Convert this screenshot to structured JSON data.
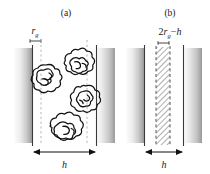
{
  "figure": {
    "type": "scientific-diagram",
    "background_color": "#ffffff",
    "ink_color": "#1a1a1a",
    "width": 210,
    "height": 174
  },
  "panel_a": {
    "label": "(a)",
    "rg_label": {
      "base": "r",
      "subscript": "g"
    },
    "gap_label": "h",
    "surfaces": [
      {
        "name": "left-surface",
        "x": 14,
        "width": 18,
        "gradient": "light-to-dark-right"
      },
      {
        "name": "right-surface",
        "x": 97,
        "width": 18,
        "gradient": "dark-to-light-right"
      }
    ],
    "dashed_lines_x": [
      41,
      87
    ],
    "coils": [
      {
        "id": "coil-1",
        "cx": 47,
        "cy": 77
      },
      {
        "id": "coil-2",
        "cx": 79,
        "cy": 63
      },
      {
        "id": "coil-3",
        "cx": 86,
        "cy": 98
      },
      {
        "id": "coil-4",
        "cx": 66,
        "cy": 127
      }
    ],
    "arrow": {
      "x1": 34,
      "x2": 95,
      "y": 152
    }
  },
  "panel_b": {
    "label": "(b)",
    "overlap_label": {
      "coefficient": "2",
      "base": "r",
      "subscript": "g",
      "operator": "−",
      "term": "h"
    },
    "gap_label": "h",
    "surfaces": [
      {
        "name": "left-surface",
        "x": 126,
        "width": 18,
        "gradient": "light-to-dark-right"
      },
      {
        "name": "right-surface",
        "x": 184,
        "width": 18,
        "gradient": "dark-to-light-right"
      }
    ],
    "hatched_region": {
      "x": 156,
      "width": 14,
      "pattern": "diagonal-hatch"
    },
    "dashed_lines_x": [
      156,
      170
    ],
    "arrow": {
      "x1": 146,
      "x2": 182,
      "y": 152
    }
  },
  "colors": {
    "ink": "#1a1a1a",
    "surface_light": "#fbfbfb",
    "surface_mid": "#d8d8d8",
    "surface_dark": "#9a9a9a",
    "hatch": "#7a7a7a",
    "dashed": "#b8b8b8"
  }
}
